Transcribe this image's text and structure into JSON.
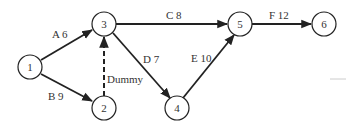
{
  "diagram": {
    "type": "activity-on-arrow network",
    "nodes": [
      {
        "id": "1",
        "label": "1",
        "x": 30,
        "y": 67
      },
      {
        "id": "2",
        "label": "2",
        "x": 104,
        "y": 108
      },
      {
        "id": "3",
        "label": "3",
        "x": 104,
        "y": 24
      },
      {
        "id": "4",
        "label": "4",
        "x": 177,
        "y": 108
      },
      {
        "id": "5",
        "label": "5",
        "x": 240,
        "y": 24
      },
      {
        "id": "6",
        "label": "6",
        "x": 324,
        "y": 24
      }
    ],
    "edges": [
      {
        "from": "1",
        "to": "3",
        "activity": "A",
        "duration": 6,
        "label": "A 6",
        "dummy": false
      },
      {
        "from": "1",
        "to": "2",
        "activity": "B",
        "duration": 9,
        "label": "B 9",
        "dummy": false
      },
      {
        "from": "2",
        "to": "3",
        "activity": "Dummy",
        "duration": null,
        "label": "Dummy",
        "dummy": true
      },
      {
        "from": "3",
        "to": "5",
        "activity": "C",
        "duration": 8,
        "label": "C 8",
        "dummy": false
      },
      {
        "from": "3",
        "to": "4",
        "activity": "D",
        "duration": 7,
        "label": "D 7",
        "dummy": false
      },
      {
        "from": "4",
        "to": "5",
        "activity": "E",
        "duration": 10,
        "label": "E 10",
        "dummy": false
      },
      {
        "from": "5",
        "to": "6",
        "activity": "F",
        "duration": 12,
        "label": "F 12",
        "dummy": false
      }
    ]
  }
}
